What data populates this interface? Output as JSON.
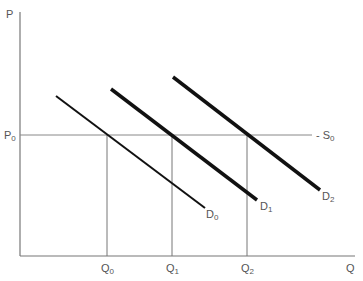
{
  "diagram": {
    "axes": {
      "y_label": "P",
      "x_label": "Q",
      "price_level": {
        "main": "P",
        "sub": "0"
      }
    },
    "supply": {
      "main": "S",
      "sub": "0"
    },
    "demand_curves": [
      {
        "id": "D0",
        "main": "D",
        "sub": "0"
      },
      {
        "id": "D1",
        "main": "D",
        "sub": "1"
      },
      {
        "id": "D2",
        "main": "D",
        "sub": "2"
      }
    ],
    "quantities": [
      {
        "id": "Q0",
        "main": "Q",
        "sub": "0"
      },
      {
        "id": "Q1",
        "main": "Q",
        "sub": "1"
      },
      {
        "id": "Q2",
        "main": "Q",
        "sub": "2"
      }
    ],
    "colors": {
      "axis": "#777777",
      "curve": "#111111",
      "label": "#555555"
    }
  }
}
